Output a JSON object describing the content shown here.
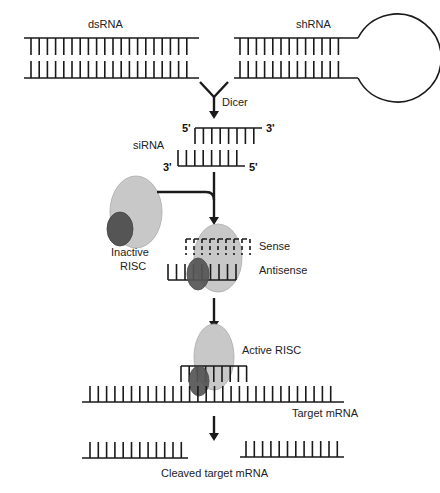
{
  "colors": {
    "line": "#1a1a1a",
    "risc_large": "#c8c8c8",
    "risc_small": "#555555",
    "background": "#ffffff"
  },
  "labels": {
    "dsrna": "dsRNA",
    "shrna": "shRNA",
    "dicer": "Dicer",
    "sirna": "siRNA",
    "five_prime_top": "5'",
    "three_prime_top": "3'",
    "three_prime_bottom": "3'",
    "five_prime_bottom": "5'",
    "inactive_risc_line1": "Inactive",
    "inactive_risc_line2": "RISC",
    "sense": "Sense",
    "antisense": "Antisense",
    "active_risc": "Active RISC",
    "target_mrna": "Target mRNA",
    "cleaved_target_mrna": "Cleaved target mRNA"
  },
  "steps": [
    "dsRNA / shRNA",
    "Dicer processing",
    "siRNA duplex",
    "RISC loading (sense / antisense)",
    "Active RISC binds target mRNA",
    "Cleaved target mRNA"
  ]
}
